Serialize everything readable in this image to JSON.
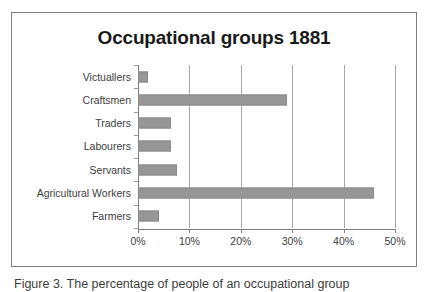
{
  "figure": {
    "caption": "Figure 3. The percentage of people of an occupational group"
  },
  "chart_data": {
    "type": "bar",
    "orientation": "horizontal",
    "title": "Occupational groups 1881",
    "xlabel": "",
    "ylabel": "",
    "categories": [
      "Victuallers",
      "Craftsmen",
      "Traders",
      "Labourers",
      "Servants",
      "Agricultural Workers",
      "Farmers"
    ],
    "values": [
      2,
      29,
      6.5,
      6.5,
      7.5,
      46,
      4
    ],
    "value_labels": [
      "2%",
      "29%",
      "6.5%",
      "6.5%",
      "7.5%",
      "46%",
      "4%"
    ],
    "xlim": [
      0,
      50
    ],
    "xticks": [
      0,
      10,
      20,
      30,
      40,
      50
    ],
    "xtick_labels": [
      "0%",
      "10%",
      "20%",
      "30%",
      "40%",
      "50%"
    ],
    "grid": "vertical",
    "legend": "none",
    "bar_color": "#969696",
    "plot_background": "#ffffff",
    "frame_color": "#808080",
    "gridline_color": "#a8a8a8",
    "text_color": "#3d3d3d"
  }
}
